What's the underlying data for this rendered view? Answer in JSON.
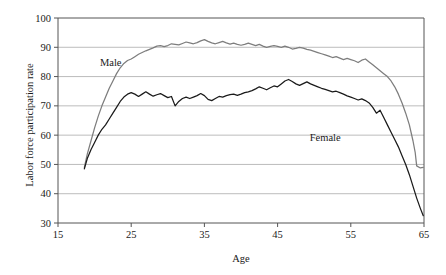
{
  "chart_data": {
    "type": "line",
    "title": "",
    "xlabel": "Age",
    "ylabel": "Labor force participation rate",
    "xlim": [
      15,
      65
    ],
    "ylim": [
      30,
      100
    ],
    "xticks": [
      15,
      25,
      35,
      45,
      55,
      65
    ],
    "yticks": [
      30,
      40,
      50,
      60,
      70,
      80,
      90,
      100
    ],
    "grid": "horizontal",
    "legend": "inline-annotations",
    "colors": {
      "male": "#7d7d7d",
      "female": "#1a1a1a",
      "grid": "#b4b4b4",
      "axis": "#555555",
      "background": "#ffffff"
    },
    "annotations": [
      {
        "text": "Male",
        "x": 22.2,
        "y": 83.5
      },
      {
        "text": "Female",
        "x": 51.5,
        "y": 58.0
      }
    ],
    "series": [
      {
        "name": "Male",
        "color": "#7d7d7d",
        "x": [
          18.6,
          19.0,
          19.5,
          20.0,
          20.5,
          21.0,
          21.5,
          22.0,
          22.5,
          23.0,
          23.5,
          24.0,
          24.5,
          25.0,
          25.5,
          26.0,
          26.5,
          27.0,
          27.5,
          28.0,
          28.5,
          29.0,
          29.5,
          30.0,
          30.5,
          31.0,
          31.5,
          32.0,
          32.5,
          33.0,
          33.5,
          34.0,
          34.5,
          35.0,
          35.5,
          36.0,
          36.5,
          37.0,
          37.5,
          38.0,
          38.5,
          39.0,
          39.5,
          40.0,
          40.5,
          41.0,
          41.5,
          42.0,
          42.5,
          43.0,
          43.5,
          44.0,
          44.5,
          45.0,
          45.5,
          46.0,
          46.5,
          47.0,
          47.5,
          48.0,
          48.5,
          49.0,
          49.5,
          50.0,
          50.5,
          51.0,
          51.5,
          52.0,
          52.5,
          53.0,
          53.5,
          54.0,
          54.5,
          55.0,
          55.5,
          56.0,
          56.5,
          57.0,
          57.5,
          58.0,
          58.5,
          59.0,
          59.5,
          60.0,
          60.5,
          61.0,
          61.5,
          62.0,
          62.5,
          63.0,
          63.5,
          63.8,
          64.0,
          64.5,
          64.9
        ],
        "y": [
          49.0,
          53.5,
          58.0,
          62.5,
          66.5,
          70.0,
          73.0,
          76.0,
          78.5,
          81.0,
          83.0,
          84.5,
          85.5,
          86.0,
          86.8,
          87.6,
          88.2,
          88.8,
          89.3,
          89.8,
          90.4,
          90.6,
          90.2,
          90.6,
          91.2,
          91.0,
          90.8,
          91.3,
          91.8,
          91.5,
          91.2,
          91.6,
          92.2,
          92.6,
          92.0,
          91.5,
          91.2,
          91.6,
          92.0,
          91.5,
          91.1,
          91.4,
          91.0,
          90.7,
          91.0,
          91.4,
          91.0,
          90.6,
          91.0,
          90.4,
          90.0,
          90.3,
          90.6,
          90.3,
          90.0,
          90.4,
          90.0,
          89.4,
          89.6,
          90.0,
          89.7,
          89.3,
          89.0,
          88.6,
          88.2,
          87.8,
          87.4,
          87.0,
          86.5,
          86.8,
          86.3,
          85.8,
          86.2,
          85.8,
          85.4,
          84.8,
          85.6,
          86.0,
          85.0,
          84.0,
          83.0,
          82.0,
          81.0,
          80.0,
          78.5,
          76.5,
          74.0,
          71.0,
          67.5,
          63.5,
          58.0,
          54.0,
          49.5,
          48.8,
          49.0
        ]
      },
      {
        "name": "Female",
        "color": "#1a1a1a",
        "x": [
          18.6,
          19.0,
          19.5,
          20.0,
          20.5,
          21.0,
          21.5,
          22.0,
          22.5,
          23.0,
          23.5,
          24.0,
          24.5,
          25.0,
          25.5,
          26.0,
          26.5,
          27.0,
          27.5,
          28.0,
          28.5,
          29.0,
          29.5,
          30.0,
          30.5,
          31.0,
          31.5,
          32.0,
          32.5,
          33.0,
          33.5,
          34.0,
          34.5,
          35.0,
          35.5,
          36.0,
          36.5,
          37.0,
          37.5,
          38.0,
          38.5,
          39.0,
          39.5,
          40.0,
          40.5,
          41.0,
          41.5,
          42.0,
          42.5,
          43.0,
          43.5,
          44.0,
          44.5,
          45.0,
          45.5,
          46.0,
          46.5,
          47.0,
          47.5,
          48.0,
          48.5,
          49.0,
          49.5,
          50.0,
          50.5,
          51.0,
          51.5,
          52.0,
          52.5,
          53.0,
          53.5,
          54.0,
          54.5,
          55.0,
          55.5,
          56.0,
          56.5,
          57.0,
          57.5,
          58.0,
          58.5,
          59.0,
          59.5,
          60.0,
          60.5,
          61.0,
          61.5,
          62.0,
          62.5,
          63.0,
          63.5,
          64.0,
          64.5,
          64.9
        ],
        "y": [
          48.5,
          52.0,
          55.0,
          57.5,
          60.0,
          62.0,
          63.5,
          65.5,
          67.5,
          69.5,
          71.5,
          73.0,
          74.0,
          74.5,
          74.0,
          73.2,
          74.0,
          74.8,
          74.0,
          73.3,
          73.8,
          74.2,
          73.5,
          72.8,
          73.2,
          70.0,
          71.5,
          72.5,
          73.0,
          72.5,
          73.0,
          73.5,
          74.2,
          73.5,
          72.2,
          71.8,
          72.5,
          73.2,
          73.0,
          73.5,
          73.8,
          74.0,
          73.6,
          74.0,
          74.5,
          74.8,
          75.2,
          75.8,
          76.5,
          76.0,
          75.5,
          76.2,
          76.8,
          76.5,
          77.5,
          78.5,
          79.0,
          78.3,
          77.5,
          77.0,
          77.6,
          78.2,
          77.5,
          77.0,
          76.5,
          76.0,
          75.6,
          75.2,
          74.8,
          75.0,
          74.5,
          74.0,
          73.4,
          73.0,
          72.5,
          72.0,
          72.4,
          71.8,
          71.0,
          69.5,
          67.5,
          68.5,
          66.0,
          63.5,
          61.0,
          58.5,
          56.0,
          53.0,
          50.0,
          46.5,
          42.5,
          38.5,
          35.0,
          32.5
        ]
      }
    ]
  }
}
